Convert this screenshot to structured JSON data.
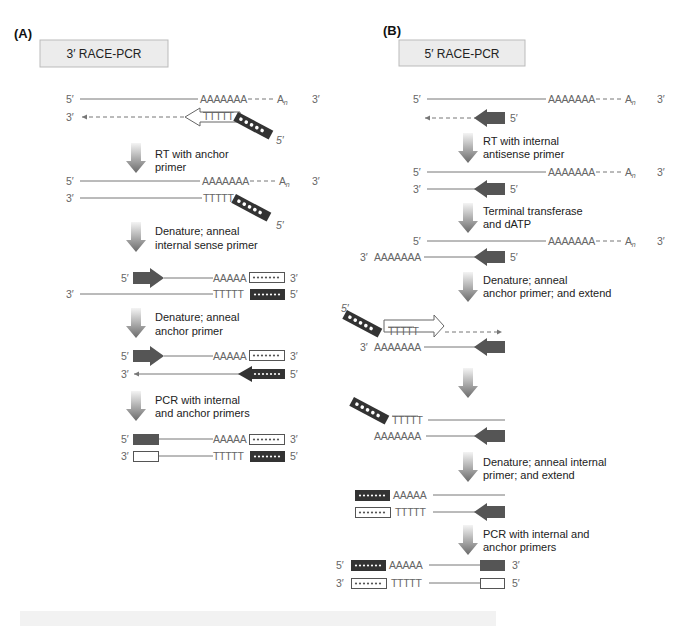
{
  "panels": {
    "A": {
      "letter": "(A)",
      "title": "3′ RACE-PCR",
      "steps": [
        "RT with anchor",
        "primer",
        "Denature; anneal",
        "internal sense primer",
        "Denature; anneal",
        "anchor primer",
        "PCR with internal",
        "and anchor primers"
      ]
    },
    "B": {
      "letter": "(B)",
      "title": "5′ RACE-PCR",
      "steps": [
        "RT with internal",
        "antisense primer",
        "Terminal transferase",
        "and dATP",
        "Denature; anneal",
        "anchor primer; and extend",
        "Denature; anneal internal",
        "primer; and extend",
        "PCR with internal and",
        "anchor primers"
      ]
    }
  },
  "labels": {
    "five": "5′",
    "three": "3′",
    "polyA7": "AAAAAAA",
    "polyA5": "AAAAA",
    "polyT5": "TTTTT",
    "An": "A",
    "n": "n",
    "dashes": "- - - - -"
  },
  "colors": {
    "primer_dark": "#555555",
    "anchor_dark": "#333333",
    "text_gray": "#666666",
    "title_box": "#ececec"
  }
}
